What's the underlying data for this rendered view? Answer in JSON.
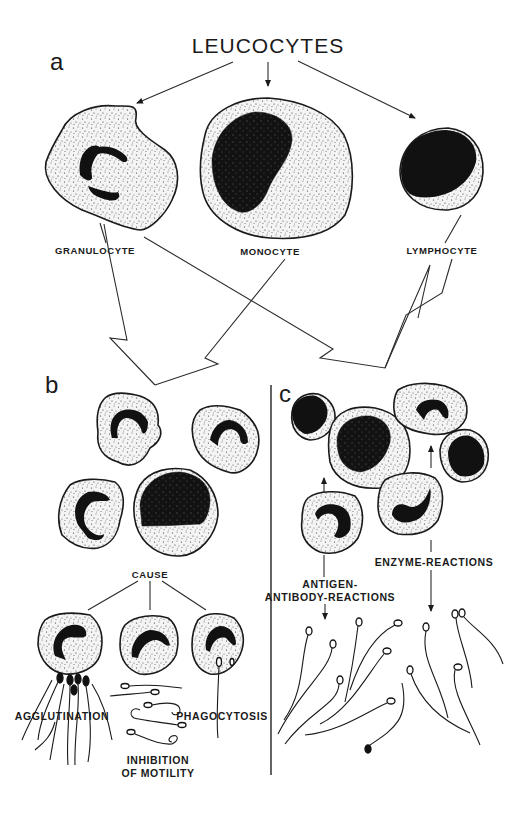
{
  "figure": {
    "title": "LEUCOCYTES",
    "panels": {
      "a": {
        "letter": "a",
        "cells": [
          {
            "label": "GRANULOCYTE"
          },
          {
            "label": "MONOCYTE"
          },
          {
            "label": "LYMPHOCYTE"
          }
        ]
      },
      "b": {
        "letter": "b",
        "cause_label": "CAUSE",
        "effects": [
          {
            "label": "AGGLUTINATION"
          },
          {
            "label_line1": "INHIBITION",
            "label_line2": "OF MOTILITY"
          },
          {
            "label": "PHAGOCYTOSIS"
          }
        ]
      },
      "c": {
        "letter": "c",
        "reactions": [
          {
            "label_line1": "ANTIGEN-",
            "label_line2": "ANTIBODY-REACTIONS"
          },
          {
            "label": "ENZYME-REACTIONS"
          }
        ]
      }
    },
    "colors": {
      "ink": "#1a1a1a",
      "background": "#ffffff"
    }
  }
}
